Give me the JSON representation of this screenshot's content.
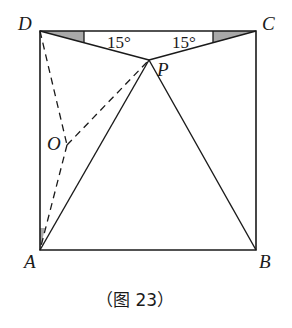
{
  "diagram": {
    "points": {
      "A": {
        "label": "A",
        "x": 40,
        "y": 250
      },
      "B": {
        "label": "B",
        "x": 256,
        "y": 250
      },
      "C": {
        "label": "C",
        "x": 256,
        "y": 31
      },
      "D": {
        "label": "D",
        "x": 40,
        "y": 31
      },
      "P": {
        "label": "P",
        "x": 149,
        "y": 60
      },
      "O": {
        "label": "O",
        "x": 67,
        "y": 145
      }
    },
    "angles": {
      "left": "15°",
      "right": "15°"
    },
    "caption": "（图 23）",
    "colors": {
      "line": "#1a1a1a",
      "shade": "#a9a9a9"
    }
  }
}
